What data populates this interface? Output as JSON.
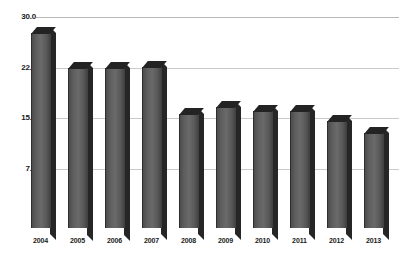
{
  "chart_data": {
    "type": "bar",
    "title": "",
    "subtitle": "",
    "xlabel": "",
    "ylabel": "",
    "categories": [
      "2004",
      "2005",
      "2006",
      "2007",
      "2008",
      "2009",
      "2010",
      "2011",
      "2012",
      "2013"
    ],
    "values": [
      27.6,
      22.5,
      22.5,
      22.6,
      15.6,
      16.6,
      16.0,
      16.0,
      14.5,
      12.7
    ],
    "ylim": [
      0,
      30
    ],
    "yticks": [
      0,
      7.5,
      15.0,
      22.5,
      30.0
    ],
    "ytick_labels": [
      "0",
      "7.5",
      "15.0",
      "22.5",
      "30.0"
    ],
    "grid": true,
    "legend": false,
    "legend_position": "none",
    "series": [
      {
        "name": "",
        "values": [
          27.6,
          22.5,
          22.5,
          22.6,
          15.6,
          16.6,
          16.0,
          16.0,
          14.5,
          12.7
        ]
      }
    ],
    "style": {
      "bar_face_color": "#5e5e5e",
      "bar_top_color": "#232323",
      "bar_side_color": "#262626",
      "gridline_color": "#c9c9c9",
      "background_color": "#ffffff",
      "text_color": "#1a1a1a",
      "three_d": true
    }
  }
}
